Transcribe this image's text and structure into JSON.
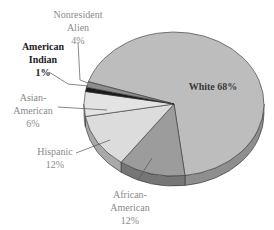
{
  "chart_data": {
    "type": "pie",
    "style": "3d",
    "title": "",
    "categories": [
      "White",
      "African-American",
      "Hispanic",
      "Asian-American",
      "American Indian",
      "Nonresident Alien"
    ],
    "values": [
      68,
      12,
      12,
      6,
      1,
      4
    ],
    "units": "%",
    "slices": [
      {
        "name": "White",
        "value": 68,
        "label": "White 68%",
        "color": "#bdbdbd",
        "side": "#8e8e8e",
        "start": -162,
        "end": 83
      },
      {
        "name": "African-American",
        "value": 12,
        "label_lines": [
          "African-",
          "American",
          "12%"
        ],
        "color": "#9c9c9c",
        "side": "#767676",
        "start": 83,
        "end": 126
      },
      {
        "name": "Hispanic",
        "value": 12,
        "label_lines": [
          "Hispanic",
          "12%"
        ],
        "color": "#dcdcdc",
        "side": "#a9a9a9",
        "start": 126,
        "end": 170
      },
      {
        "name": "Asian-American",
        "value": 6,
        "label_lines": [
          "Asian-",
          "American",
          "6%"
        ],
        "color": "#e3e3e3",
        "side": "#b0b0b0",
        "start": 170,
        "end": 190
      },
      {
        "name": "American Indian",
        "value": 1,
        "label_lines": [
          "American",
          "Indian",
          "1%"
        ],
        "color": "#1a1a1a",
        "side": "#111111",
        "start": 190,
        "end": 193.5
      },
      {
        "name": "Nonresident Alien",
        "value": 4,
        "label_lines": [
          "Nonresident",
          "Alien",
          "4%"
        ],
        "color": "#8c8c8c",
        "side": "#6c6c6c",
        "start": 193.5,
        "end": 198
      }
    ],
    "legend": "none",
    "labels": "external with leader lines"
  },
  "labels": {
    "white": "White 68%",
    "nonresident": [
      "Nonresident",
      "Alien",
      "4%"
    ],
    "american_indian": [
      "American",
      "Indian",
      "1%"
    ],
    "asian": [
      "Asian-",
      "American",
      "6%"
    ],
    "hispanic": [
      "Hispanic",
      "12%"
    ],
    "african": [
      "African-",
      "American",
      "12%"
    ]
  }
}
